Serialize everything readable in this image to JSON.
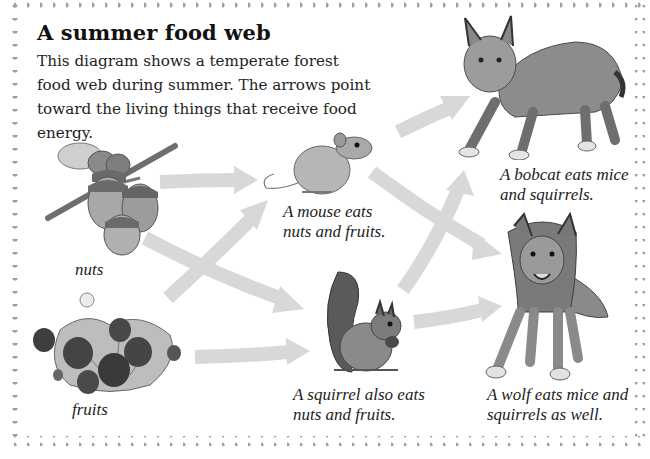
{
  "diagram": {
    "title": "A summer food web",
    "description": "This diagram shows a temperate forest food web during summer. The arrows point toward the living things that receive food energy.",
    "colors": {
      "background": "#ffffff",
      "border_dots": "#a0a0a0",
      "arrow": "#d8d8d8",
      "text": "#1a1a1a"
    },
    "nodes": [
      {
        "id": "nuts",
        "label": "nuts",
        "image": "acorns-on-twig"
      },
      {
        "id": "fruits",
        "label": "fruits",
        "image": "strawberry-plant"
      },
      {
        "id": "mouse",
        "label": "A mouse eats\nnuts and fruits.",
        "image": "mouse"
      },
      {
        "id": "squirrel",
        "label": "A squirrel also eats\nnuts and fruits.",
        "image": "squirrel"
      },
      {
        "id": "bobcat",
        "label": "A bobcat eats mice\nand squirrels.",
        "image": "bobcat"
      },
      {
        "id": "wolf",
        "label": "A wolf eats mice and\nsquirrels as well.",
        "image": "wolf"
      }
    ],
    "edges": [
      {
        "from": "nuts",
        "to": "mouse"
      },
      {
        "from": "nuts",
        "to": "squirrel"
      },
      {
        "from": "fruits",
        "to": "mouse"
      },
      {
        "from": "fruits",
        "to": "squirrel"
      },
      {
        "from": "mouse",
        "to": "bobcat"
      },
      {
        "from": "mouse",
        "to": "wolf"
      },
      {
        "from": "squirrel",
        "to": "bobcat"
      },
      {
        "from": "squirrel",
        "to": "wolf"
      }
    ]
  }
}
